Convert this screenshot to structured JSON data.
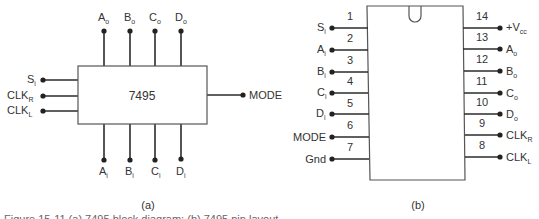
{
  "diagram_a": {
    "chip_label": "7495",
    "caption": "(a)",
    "top_pins": [
      {
        "label": "A",
        "sub": "o"
      },
      {
        "label": "B",
        "sub": "o"
      },
      {
        "label": "C",
        "sub": "o"
      },
      {
        "label": "D",
        "sub": "o"
      }
    ],
    "bottom_pins": [
      {
        "label": "A",
        "sub": "i"
      },
      {
        "label": "B",
        "sub": "i"
      },
      {
        "label": "C",
        "sub": "i"
      },
      {
        "label": "D",
        "sub": "i"
      }
    ],
    "left_pins": [
      {
        "label": "S",
        "sub": "i"
      },
      {
        "label": "CLK",
        "sub": "R"
      },
      {
        "label": "CLK",
        "sub": "L"
      }
    ],
    "right_pins": [
      {
        "label": "MODE",
        "sub": ""
      }
    ]
  },
  "diagram_b": {
    "caption": "(b)",
    "left_pins": [
      {
        "num": "1",
        "label": "S",
        "sub": "i"
      },
      {
        "num": "2",
        "label": "A",
        "sub": "i"
      },
      {
        "num": "3",
        "label": "B",
        "sub": "i"
      },
      {
        "num": "4",
        "label": "C",
        "sub": "i"
      },
      {
        "num": "5",
        "label": "D",
        "sub": "i"
      },
      {
        "num": "6",
        "label": "MODE",
        "sub": ""
      },
      {
        "num": "7",
        "label": "Gnd",
        "sub": ""
      }
    ],
    "right_pins": [
      {
        "num": "14",
        "label": "+V",
        "sub": "cc"
      },
      {
        "num": "13",
        "label": "A",
        "sub": "o"
      },
      {
        "num": "12",
        "label": "B",
        "sub": "o"
      },
      {
        "num": "11",
        "label": "C",
        "sub": "o"
      },
      {
        "num": "10",
        "label": "D",
        "sub": "o"
      },
      {
        "num": "9",
        "label": "CLK",
        "sub": "R"
      },
      {
        "num": "8",
        "label": "CLK",
        "sub": "L"
      }
    ]
  },
  "figure_caption_clipped": "Figure 15-11  (a) 7495 block diagram; (b) 7495 pin layout"
}
